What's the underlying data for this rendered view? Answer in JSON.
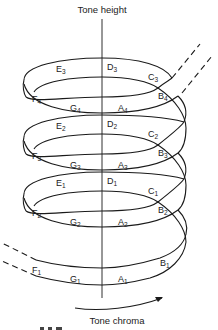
{
  "diagram": {
    "title_top": "Tone height",
    "title_bottom": "Tone chroma",
    "colors": {
      "stroke": "#1a1a1a",
      "text": "#222222",
      "background": "#ffffff"
    },
    "turns": [
      {
        "octave": 4,
        "labels": [
          {
            "note": "E",
            "sub": "3",
            "x": 56,
            "y": 72
          },
          {
            "note": "D",
            "sub": "3",
            "x": 107,
            "y": 70
          },
          {
            "note": "C",
            "sub": "3",
            "x": 148,
            "y": 80
          },
          {
            "note": "B",
            "sub": "4",
            "x": 158,
            "y": 99
          },
          {
            "note": "F",
            "sub": "4",
            "x": 32,
            "y": 102
          },
          {
            "note": "G",
            "sub": "4",
            "x": 70,
            "y": 111
          },
          {
            "note": "A",
            "sub": "4",
            "x": 118,
            "y": 111
          }
        ]
      },
      {
        "octave": 3,
        "labels": [
          {
            "note": "E",
            "sub": "2",
            "x": 56,
            "y": 129
          },
          {
            "note": "D",
            "sub": "2",
            "x": 107,
            "y": 127
          },
          {
            "note": "C",
            "sub": "2",
            "x": 148,
            "y": 137
          },
          {
            "note": "B",
            "sub": "3",
            "x": 158,
            "y": 156
          },
          {
            "note": "F",
            "sub": "3",
            "x": 32,
            "y": 159
          },
          {
            "note": "G",
            "sub": "3",
            "x": 70,
            "y": 168
          },
          {
            "note": "A",
            "sub": "3",
            "x": 118,
            "y": 168
          }
        ]
      },
      {
        "octave": 2,
        "labels": [
          {
            "note": "E",
            "sub": "1",
            "x": 56,
            "y": 186
          },
          {
            "note": "D",
            "sub": "1",
            "x": 107,
            "y": 184
          },
          {
            "note": "C",
            "sub": "1",
            "x": 148,
            "y": 194
          },
          {
            "note": "B",
            "sub": "2",
            "x": 158,
            "y": 213
          },
          {
            "note": "F",
            "sub": "2",
            "x": 32,
            "y": 216
          },
          {
            "note": "G",
            "sub": "2",
            "x": 70,
            "y": 225
          },
          {
            "note": "A",
            "sub": "2",
            "x": 118,
            "y": 225
          }
        ]
      },
      {
        "octave": 1,
        "labels": [
          {
            "note": "B",
            "sub": "1",
            "x": 160,
            "y": 266
          },
          {
            "note": "F",
            "sub": "1",
            "x": 32,
            "y": 273
          },
          {
            "note": "G",
            "sub": "1",
            "x": 70,
            "y": 282
          },
          {
            "note": "A",
            "sub": "1",
            "x": 118,
            "y": 282
          }
        ]
      }
    ],
    "caption_partial": "..."
  }
}
